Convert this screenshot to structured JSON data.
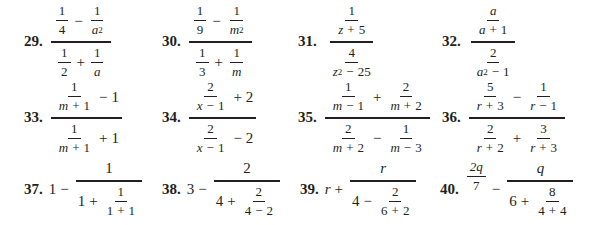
{
  "exercises": [
    {
      "number": "29.",
      "expression": "(1/4 - 1/a^2) / (1/2 + 1/a)"
    },
    {
      "number": "30.",
      "expression": "(1/9 - 1/m^2) / (1/3 + 1/m)"
    },
    {
      "number": "31.",
      "expression": "(1/(z + 5)) / (4/(z^2 - 25))"
    },
    {
      "number": "32.",
      "expression": "(a/(a + 1)) / (2/(a^2 - 1))"
    },
    {
      "number": "33.",
      "expression": "(1/(m + 1) - 1) / (1/(m + 1) + 1)"
    },
    {
      "number": "34.",
      "expression": "(2/(x - 1) + 2) / (2/(x - 1) - 2)"
    },
    {
      "number": "35.",
      "expression": "(1/(m - 1) + 2/(m + 2)) / (2/(m + 2) - 1/(m - 3))"
    },
    {
      "number": "36.",
      "expression": "(5/(r + 3) - 1/(r - 1)) / (2/(r + 2) + 3/(r + 3))"
    },
    {
      "number": "37.",
      "expression": "1 - 1/(1 + 1/(1 + 1))"
    },
    {
      "number": "38.",
      "expression": "3 - 2/(4 + 2/(4 - 2))"
    },
    {
      "number": "39.",
      "expression": "r + r/(4 - 2/(6 + 2))"
    },
    {
      "number": "40.",
      "expression": "2q/7 - q/(6 + 8/(4 + 4))"
    }
  ],
  "tokens": {
    "one": "1",
    "two": "2",
    "three": "3",
    "four": "4",
    "five": "5",
    "six": "6",
    "seven": "7",
    "eight": "8",
    "nine": "9",
    "twentyfive": "25",
    "minus": "−",
    "plus": "+",
    "a": "a",
    "m": "m",
    "z": "z",
    "x": "x",
    "r": "r",
    "q": "q",
    "sq": "2",
    "two_q": "2q"
  }
}
